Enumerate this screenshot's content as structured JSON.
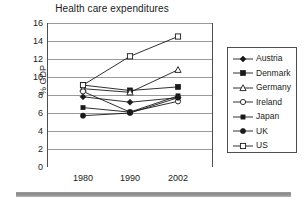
{
  "chart_data": {
    "type": "line",
    "title": "Health care expenditures",
    "xlabel": "",
    "ylabel": "% GDP",
    "categories": [
      "1980",
      "1990",
      "2002"
    ],
    "ylim": [
      0,
      16
    ],
    "ytick_step": 2,
    "yticks": [
      "16",
      "14",
      "12",
      "10",
      "8",
      "6",
      "4",
      "2",
      "0"
    ],
    "grid": "horizontal",
    "legend_position": "right",
    "series": [
      {
        "name": "Austria",
        "marker": "filled-diamond",
        "values": [
          7.8,
          7.2,
          7.7
        ]
      },
      {
        "name": "Denmark",
        "marker": "filled-square",
        "values": [
          9.1,
          8.5,
          8.9
        ]
      },
      {
        "name": "Germany",
        "marker": "open-triangle",
        "values": [
          8.7,
          8.3,
          10.8
        ]
      },
      {
        "name": "Ireland",
        "marker": "open-circle",
        "values": [
          8.4,
          6.1,
          7.3
        ]
      },
      {
        "name": "Japan",
        "marker": "filled-square-small",
        "values": [
          6.6,
          6.1,
          7.9
        ]
      },
      {
        "name": "UK",
        "marker": "filled-circle",
        "values": [
          5.7,
          6.0,
          7.7
        ]
      },
      {
        "name": "US",
        "marker": "open-square",
        "values": [
          9.1,
          12.3,
          14.5
        ]
      }
    ]
  },
  "legend": {
    "items": [
      {
        "label": "Austria"
      },
      {
        "label": "Denmark"
      },
      {
        "label": "Germany"
      },
      {
        "label": "Ireland"
      },
      {
        "label": "Japan"
      },
      {
        "label": "UK"
      },
      {
        "label": "US"
      }
    ]
  },
  "colors": {
    "line": "#1a1a1a",
    "grid": "#808080",
    "axis": "#4d4d4d",
    "background": "#ffffff"
  }
}
